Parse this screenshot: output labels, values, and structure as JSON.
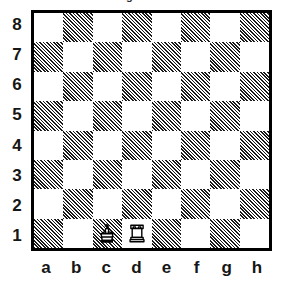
{
  "diagram": {
    "type": "chess-board-diagram",
    "orientation": "white-bottom",
    "top_artifact": "g",
    "board": {
      "files": [
        "a",
        "b",
        "c",
        "d",
        "e",
        "f",
        "g",
        "h"
      ],
      "ranks": [
        "8",
        "7",
        "6",
        "5",
        "4",
        "3",
        "2",
        "1"
      ],
      "light_square_color": "#ffffff",
      "dark_square_color": "#1a1a1a",
      "border_color": "#000000",
      "dark_square_fill_style": "diagonal-hatch",
      "light_squares": [
        "a8",
        "c8",
        "e8",
        "g8",
        "b7",
        "d7",
        "f7",
        "h7",
        "a6",
        "c6",
        "e6",
        "g6",
        "b5",
        "d5",
        "f5",
        "h5",
        "a4",
        "c4",
        "e4",
        "g4",
        "b3",
        "d3",
        "f3",
        "h3",
        "a2",
        "c2",
        "e2",
        "g2",
        "b1",
        "d1",
        "f1",
        "h1"
      ],
      "dark_squares": [
        "b8",
        "d8",
        "f8",
        "h8",
        "a7",
        "c7",
        "e7",
        "g7",
        "b6",
        "d6",
        "f6",
        "h6",
        "a5",
        "c5",
        "e5",
        "g5",
        "b4",
        "d4",
        "f4",
        "h4",
        "a3",
        "c3",
        "e3",
        "g3",
        "b2",
        "d2",
        "f2",
        "h2",
        "a1",
        "c1",
        "e1",
        "g1"
      ]
    },
    "pieces": [
      {
        "square": "c1",
        "color": "white",
        "type": "king",
        "icon": "white-king-icon",
        "label": "White King"
      },
      {
        "square": "d1",
        "color": "white",
        "type": "rook",
        "icon": "white-rook-icon",
        "label": "White Rook"
      }
    ],
    "position_fen": "8/8/8/8/8/8/8/2KR4 w - - 0 1",
    "piece_count": 2
  }
}
